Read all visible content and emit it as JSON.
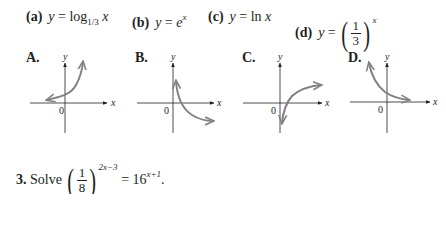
{
  "choices": [
    {
      "letter": "(a)",
      "lhs": "y",
      "eq": "=",
      "func": "log",
      "sub": "1/3",
      "arg": "x"
    },
    {
      "letter": "(b)",
      "lhs": "y",
      "eq": "=",
      "base": "e",
      "exp": "x"
    },
    {
      "letter": "(c)",
      "lhs": "y",
      "eq": "=",
      "func": "ln",
      "arg": "x"
    },
    {
      "letter": "(d)",
      "lhs": "y",
      "eq": "=",
      "num": "1",
      "den": "3",
      "exp": "x"
    }
  ],
  "graphs": [
    {
      "label": "A.",
      "origin": "0",
      "x_axis": "x",
      "y_axis": "y",
      "curve": "increasing exponential (e^x shape)"
    },
    {
      "label": "B.",
      "origin": "0",
      "x_axis": "x",
      "y_axis": "y",
      "curve": "decreasing logarithmic (log base 1/3 shape)"
    },
    {
      "label": "C.",
      "origin": "0",
      "x_axis": "x",
      "y_axis": "y",
      "curve": "increasing logarithmic (ln x shape)"
    },
    {
      "label": "D.",
      "origin": "0",
      "x_axis": "x",
      "y_axis": "y",
      "curve": "decreasing exponential ((1/3)^x shape)"
    }
  ],
  "problem": {
    "number": "3.",
    "verb": "Solve",
    "num": "1",
    "den": "8",
    "exp_left": "2x−3",
    "eq": "=",
    "base_right": "16",
    "exp_right": "x+1",
    "end": "."
  },
  "colors": {
    "text": "#231f20",
    "curve": "#808285",
    "axis": "#231f20"
  }
}
